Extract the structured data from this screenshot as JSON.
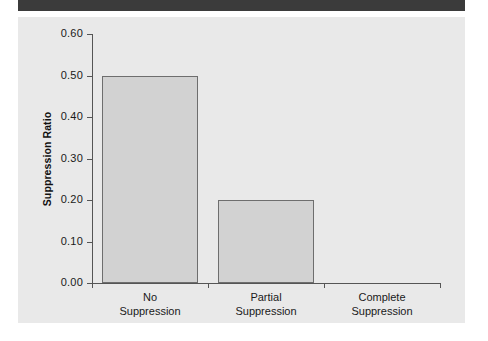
{
  "figure": {
    "header_band_color": "#3b3b3b",
    "panel_color": "#e9e9e9",
    "bar_fill_color": "#d2d2d2",
    "bar_border_color": "#6e6e6e",
    "axis_color": "#555555"
  },
  "chart_data": {
    "type": "bar",
    "title": "",
    "xlabel": "",
    "ylabel": "Suppression Ratio",
    "categories": [
      "No Suppression",
      "Partial Suppression",
      "Complete Suppression"
    ],
    "category_lines": [
      [
        "No",
        "Suppression"
      ],
      [
        "Partial",
        "Suppression"
      ],
      [
        "Complete",
        "Suppression"
      ]
    ],
    "values": [
      0.5,
      0.2,
      0.0
    ],
    "ylim": [
      0.0,
      0.6
    ],
    "yticks": [
      0.0,
      0.1,
      0.2,
      0.3,
      0.4,
      0.5,
      0.6
    ],
    "ytick_labels": [
      "0.00",
      "0.10",
      "0.20",
      "0.30",
      "0.40",
      "0.50",
      "0.60"
    ],
    "grid": false,
    "legend": "none"
  }
}
